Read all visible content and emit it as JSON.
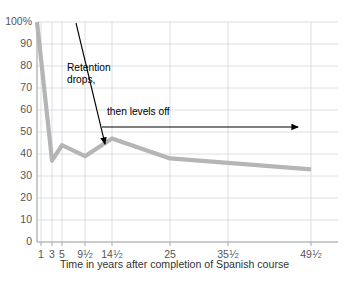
{
  "chart_data": {
    "type": "line",
    "title": "",
    "xlabel": "Time in years after completion of Spanish course",
    "ylabel": "",
    "x_tick_labels": [
      "1",
      "3",
      "5",
      "9½",
      "14½",
      "25",
      "35½",
      "49½"
    ],
    "x_tick_values": [
      1,
      3,
      5,
      9.5,
      14.5,
      25,
      35.5,
      49.5
    ],
    "x_tick_positions_px": [
      41,
      52,
      62,
      85,
      112,
      170,
      228,
      311
    ],
    "y_tick_labels": [
      "0",
      "10",
      "20",
      "30",
      "40",
      "50",
      "60",
      "70",
      "80",
      "90",
      "100%"
    ],
    "y_tick_values": [
      0,
      10,
      20,
      30,
      40,
      50,
      60,
      70,
      80,
      90,
      100
    ],
    "ylim": [
      0,
      100
    ],
    "grid": true,
    "legend": "none",
    "series": [
      {
        "name": "Retention of Spanish",
        "color": "#b5b5b5",
        "x": [
          0,
          3,
          5,
          9.5,
          14.5,
          25,
          35.5,
          49.5
        ],
        "values": [
          100,
          37,
          44,
          39,
          47,
          38,
          36,
          33
        ],
        "x_px": [
          37,
          52,
          62,
          85,
          112,
          170,
          228,
          311
        ],
        "y_px": [
          32,
          164,
          150,
          160,
          143,
          162,
          166,
          173
        ]
      }
    ],
    "annotations": [
      {
        "name": "retention-drops",
        "text_lines": [
          "Retention",
          "drops,"
        ],
        "arrow": {
          "x1": 76,
          "y1": 23,
          "x2": 105,
          "y2": 144
        }
      },
      {
        "name": "then-levels-off",
        "text_lines": [
          "then levels off"
        ],
        "arrow": {
          "x1": 102,
          "y1": 127,
          "x2": 298,
          "y2": 127
        }
      }
    ]
  },
  "annotations": {
    "retention_line1": "Retention",
    "retention_line2": "drops,",
    "levels_off": "then levels off"
  },
  "axis": {
    "x_title": "Time in years after completion of Spanish course"
  },
  "y_ticks": [
    {
      "label": "100%",
      "value": 100
    },
    {
      "label": "90",
      "value": 90
    },
    {
      "label": "80",
      "value": 80
    },
    {
      "label": "70",
      "value": 70
    },
    {
      "label": "60",
      "value": 60
    },
    {
      "label": "50",
      "value": 50
    },
    {
      "label": "40",
      "value": 40
    },
    {
      "label": "30",
      "value": 30
    },
    {
      "label": "20",
      "value": 20
    },
    {
      "label": "10",
      "value": 10
    },
    {
      "label": "0",
      "value": 0
    }
  ],
  "x_ticks": [
    {
      "label": "1",
      "whole": "1",
      "num": "",
      "den": ""
    },
    {
      "label": "3",
      "whole": "3",
      "num": "",
      "den": ""
    },
    {
      "label": "5",
      "whole": "5",
      "num": "",
      "den": ""
    },
    {
      "label": "9½",
      "whole": "9",
      "num": "1",
      "den": "2"
    },
    {
      "label": "14½",
      "whole": "14",
      "num": "1",
      "den": "2"
    },
    {
      "label": "25",
      "whole": "25",
      "num": "",
      "den": ""
    },
    {
      "label": "35½",
      "whole": "35",
      "num": "1",
      "den": "2"
    },
    {
      "label": "49½",
      "whole": "49",
      "num": "1",
      "den": "2"
    }
  ],
  "colors": {
    "line": "#b5b5b5",
    "grid": "#cfd6e0",
    "axis": "#a8a8a8",
    "text": "#555555",
    "annotation": "#000000",
    "background": "#ffffff"
  }
}
